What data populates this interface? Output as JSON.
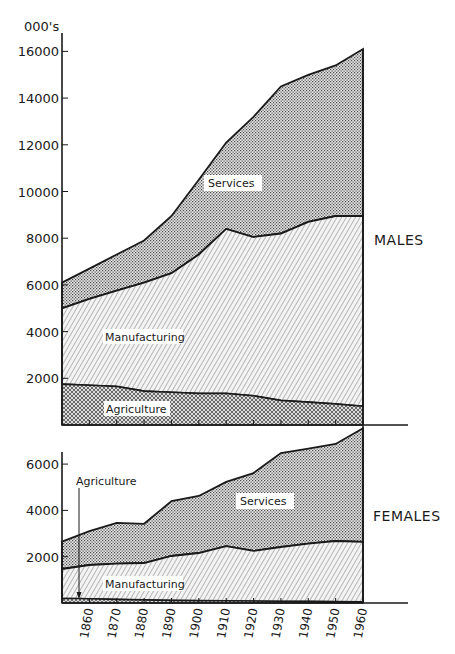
{
  "chart_data": [
    {
      "type": "area",
      "stacked": true,
      "title": "MALES",
      "ylabel": "000's",
      "xlabel": "",
      "ylim": [
        0,
        16500
      ],
      "yticks": [
        2000,
        4000,
        6000,
        8000,
        10000,
        12000,
        14000,
        16000
      ],
      "x": [
        1851,
        1861,
        1871,
        1881,
        1891,
        1901,
        1911,
        1921,
        1931,
        1941,
        1951,
        1961
      ],
      "series": [
        {
          "name": "Agriculture",
          "values": [
            1750,
            1700,
            1650,
            1450,
            1400,
            1350,
            1350,
            1250,
            1050,
            980,
            900,
            800
          ]
        },
        {
          "name": "Manufacturing",
          "values": [
            3250,
            3700,
            4100,
            4650,
            5100,
            5950,
            7050,
            6800,
            7150,
            7720,
            8050,
            8150
          ]
        },
        {
          "name": "Services",
          "values": [
            1100,
            1300,
            1550,
            1800,
            2450,
            3200,
            3700,
            5150,
            6300,
            6300,
            6450,
            7150
          ]
        }
      ],
      "cumulative_tops": {
        "Agriculture": [
          1750,
          1700,
          1650,
          1450,
          1400,
          1350,
          1350,
          1250,
          1050,
          980,
          900,
          800
        ],
        "Manufacturing": [
          5000,
          5400,
          5750,
          6100,
          6500,
          7300,
          8400,
          8050,
          8200,
          8700,
          8950,
          8950
        ],
        "Services": [
          6100,
          6700,
          7300,
          7900,
          8950,
          10500,
          12100,
          13200,
          14500,
          15000,
          15400,
          16100
        ]
      },
      "labels": {
        "services": "Services",
        "manufacturing": "Manufacturing",
        "agriculture": "Agriculture",
        "panel": "MALES"
      }
    },
    {
      "type": "area",
      "stacked": true,
      "title": "FEMALES",
      "ylabel": "000's",
      "xlabel": "",
      "ylim": [
        0,
        7600
      ],
      "yticks": [
        2000,
        4000,
        6000
      ],
      "x": [
        1851,
        1861,
        1871,
        1881,
        1891,
        1901,
        1911,
        1921,
        1931,
        1941,
        1951,
        1961
      ],
      "series": [
        {
          "name": "Agriculture",
          "values": [
            200,
            180,
            150,
            130,
            110,
            100,
            90,
            80,
            70,
            65,
            60,
            50
          ]
        },
        {
          "name": "Manufacturing",
          "values": [
            1270,
            1460,
            1550,
            1600,
            1920,
            2060,
            2370,
            2170,
            2350,
            2495,
            2620,
            2590
          ]
        },
        {
          "name": "Services",
          "values": [
            1180,
            1460,
            1760,
            1690,
            2370,
            2460,
            2770,
            3360,
            4060,
            4110,
            4190,
            4910
          ]
        }
      ],
      "cumulative_tops": {
        "Agriculture": [
          200,
          180,
          150,
          130,
          110,
          100,
          90,
          80,
          70,
          65,
          60,
          50
        ],
        "Manufacturing": [
          1470,
          1640,
          1700,
          1730,
          2030,
          2160,
          2460,
          2250,
          2420,
          2560,
          2680,
          2640
        ],
        "Services": [
          2650,
          3100,
          3460,
          3420,
          4400,
          4620,
          5230,
          5610,
          6480,
          6670,
          6870,
          7550
        ]
      },
      "labels": {
        "services": "Services",
        "manufacturing": "Manufacturing",
        "agriculture": "Agriculture",
        "panel": "FEMALES"
      }
    }
  ],
  "axis": {
    "unit_label": "000's",
    "male_yticks": [
      "16000",
      "14000",
      "12000",
      "10000",
      "8000",
      "6000",
      "4000",
      "2000"
    ],
    "female_yticks": [
      "6000",
      "4000",
      "2000"
    ],
    "xticks": [
      "1860",
      "1870",
      "1880",
      "1890",
      "1900",
      "1910",
      "1920",
      "1930",
      "1940",
      "1950",
      "1960"
    ]
  },
  "panels": {
    "males": {
      "label": "MALES",
      "services": "Services",
      "manufacturing": "Manufacturing",
      "agriculture": "Agriculture"
    },
    "females": {
      "label": "FEMALES",
      "services": "Services",
      "manufacturing": "Manufacturing",
      "agriculture": "Agriculture"
    }
  },
  "colors": {
    "ink": "#1a1a1a",
    "paper": "#ffffff",
    "stipple_bg": "#d9d9d9"
  }
}
